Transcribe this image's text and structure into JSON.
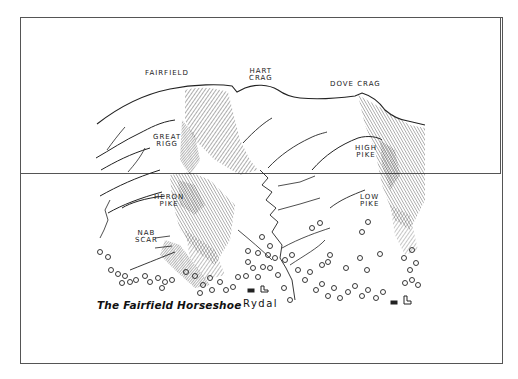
{
  "illustration": {
    "title": "The Fairfield Horseshoe",
    "village": "Rydal",
    "summits": [
      {
        "name": "FAIRFIELD",
        "lines": [
          "FAIRFIELD"
        ]
      },
      {
        "name": "HART CRAG",
        "lines": [
          "HART",
          "CRAG"
        ]
      },
      {
        "name": "DOVE CRAG",
        "lines": [
          "DOVE CRAG"
        ]
      },
      {
        "name": "GREAT RIGG",
        "lines": [
          "GREAT",
          "RIGG"
        ]
      },
      {
        "name": "HIGH PIKE",
        "lines": [
          "HIGH",
          "PIKE"
        ]
      },
      {
        "name": "HERON PIKE",
        "lines": [
          "HERON",
          "PIKE"
        ]
      },
      {
        "name": "LOW PIKE",
        "lines": [
          "LOW",
          "PIKE"
        ]
      },
      {
        "name": "NAB SCAR",
        "lines": [
          "NAB",
          "SCAR"
        ]
      }
    ],
    "colors": {
      "ink": "#222222",
      "paper": "#ffffff",
      "border": "#555555"
    }
  }
}
